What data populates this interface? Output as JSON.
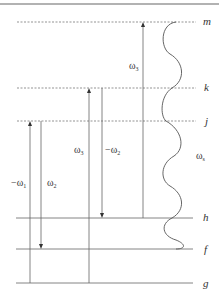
{
  "diagram": {
    "type": "energy-level-diagram",
    "colors": {
      "line": "#555555",
      "text": "#333333",
      "border": "#666666"
    },
    "levels": [
      {
        "id": "m",
        "label": "m",
        "y": 22,
        "style": "dashed"
      },
      {
        "id": "k",
        "label": "k",
        "y": 88,
        "style": "dashed"
      },
      {
        "id": "j",
        "label": "j",
        "y": 121,
        "style": "dashed"
      },
      {
        "id": "h",
        "label": "h",
        "y": 218,
        "style": "solid"
      },
      {
        "id": "f",
        "label": "f",
        "y": 249,
        "style": "solid"
      },
      {
        "id": "g",
        "label": "g",
        "y": 283,
        "style": "solid"
      }
    ],
    "transitions": [
      {
        "id": "neg-omega1",
        "label_main": "−ω",
        "label_sub": "1",
        "x": 30,
        "from": "g",
        "to": "j",
        "arrow": "up"
      },
      {
        "id": "omega2",
        "label_main": "ω",
        "label_sub": "2",
        "x": 41,
        "from": "j",
        "to": "f",
        "arrow": "down"
      },
      {
        "id": "omega3-left",
        "label_main": "ω",
        "label_sub": "3",
        "x": 89,
        "from": "g",
        "to": "k",
        "arrow": "up"
      },
      {
        "id": "neg-omega2",
        "label_main": "−ω",
        "label_sub": "2",
        "x": 102,
        "from": "k",
        "to": "h",
        "arrow": "down"
      },
      {
        "id": "omega3-right",
        "label_main": "ω",
        "label_sub": "3",
        "x": 143,
        "from": "h",
        "to": "m",
        "arrow": "up"
      }
    ],
    "signal": {
      "id": "omega-s",
      "label_main": "ω",
      "label_sub": "s",
      "from": "m",
      "to": "f",
      "style": "wavy"
    }
  }
}
